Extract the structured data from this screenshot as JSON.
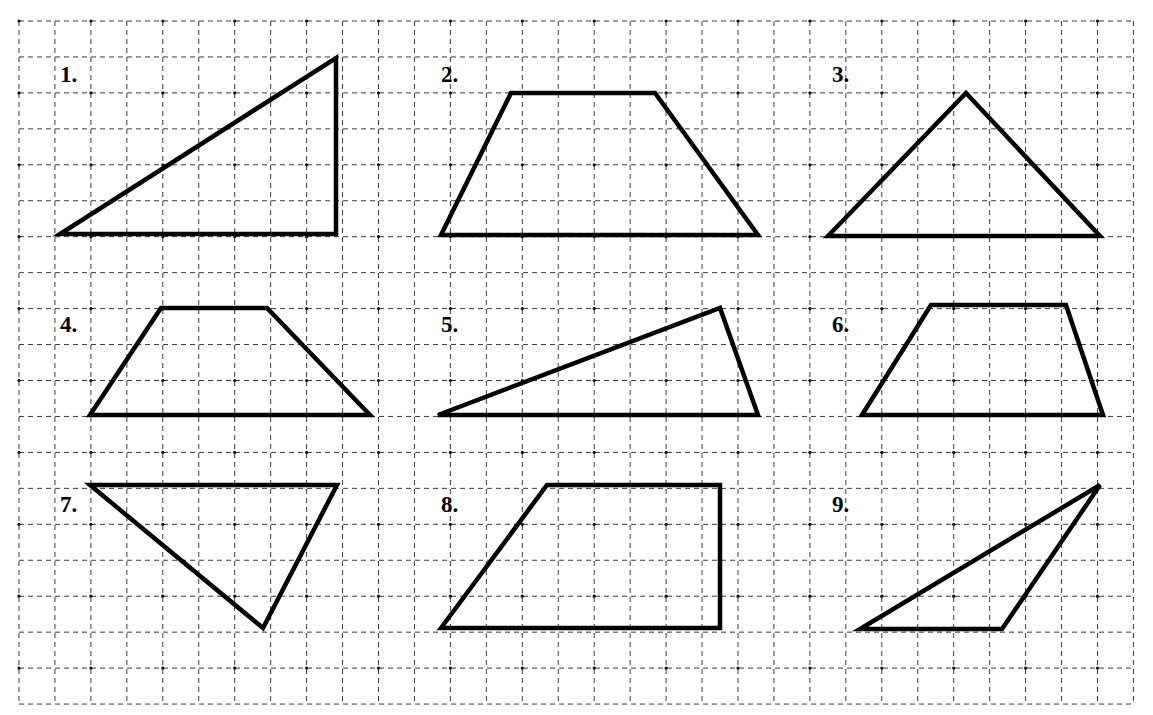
{
  "worksheet": {
    "title": "Geometry Shapes Grid Worksheet",
    "background_color": "#ffffff",
    "width": 1153,
    "height": 715
  },
  "grid": {
    "origin_x": 19,
    "origin_y": 21,
    "cell_size": 35.95,
    "columns": 31,
    "rows": 19,
    "line_color": "#3a3a4a",
    "line_style": "dashed",
    "dash_pattern": "5,4",
    "line_width": 1,
    "dot_color": "#101018",
    "dot_radius": 1.6
  },
  "shapes_style": {
    "stroke_color": "#000000",
    "stroke_width": 4.5,
    "fill": "none",
    "line_join": "miter"
  },
  "shapes": [
    {
      "number": "1.",
      "name": "right-triangle",
      "label_x": 60,
      "label_y": 63,
      "points": "60,234 336,234 336,58"
    },
    {
      "number": "2.",
      "name": "isosceles-trapezoid",
      "label_x": 441,
      "label_y": 63,
      "points": "441,235 511,93 655,93 758,235"
    },
    {
      "number": "3.",
      "name": "acute-triangle",
      "label_x": 832,
      "label_y": 63,
      "points": "828,236 966,93 1100,236"
    },
    {
      "number": "4.",
      "name": "trapezoid-wide-base",
      "label_x": 60,
      "label_y": 313,
      "points": "90,415 161,308 267,308 370,415"
    },
    {
      "number": "5.",
      "name": "obtuse-scalene-triangle",
      "label_x": 441,
      "label_y": 313,
      "points": "438,415 720,308 758,415"
    },
    {
      "number": "6.",
      "name": "trapezoid-short",
      "label_x": 832,
      "label_y": 313,
      "points": "862,415 931,305 1066,305 1103,415"
    },
    {
      "number": "7.",
      "name": "inverted-triangle",
      "label_x": 60,
      "label_y": 493,
      "points": "90,485 337,485 263,628"
    },
    {
      "number": "8.",
      "name": "right-trapezoid",
      "label_x": 441,
      "label_y": 493,
      "points": "441,628 547,485 720,485 720,628"
    },
    {
      "number": "9.",
      "name": "thin-scalene-triangle",
      "label_x": 832,
      "label_y": 493,
      "points": "860,629 1002,629 1100,485"
    }
  ]
}
